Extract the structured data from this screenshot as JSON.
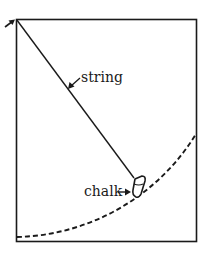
{
  "diagram": {
    "labels": {
      "string": "string",
      "chalk": "chalk"
    },
    "elements": {
      "board": {
        "shape": "rectangle",
        "x": 16,
        "y": 19,
        "width": 180,
        "height": 222
      },
      "pivot": {
        "x": 16,
        "y": 19,
        "description": "string pinned at top-left corner"
      },
      "string": {
        "from": [
          16,
          19
        ],
        "to": [
          134,
          178
        ]
      },
      "arc": {
        "center": [
          16,
          19
        ],
        "radius": 214,
        "style": "dashed"
      },
      "chalk": {
        "approx_center": [
          139,
          187
        ]
      }
    },
    "colors": {
      "stroke": "#1a1a1a",
      "background": "#ffffff"
    }
  }
}
